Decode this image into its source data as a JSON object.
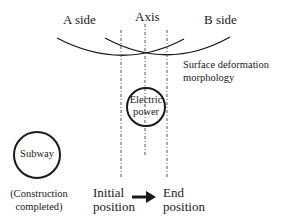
{
  "labels": {
    "a_side": "A side",
    "axis": "Axis",
    "b_side": "B side",
    "surface_line1": "Surface deformation",
    "surface_line2": "morphology",
    "electric_line1": "Electric",
    "electric_line2": "power",
    "subway": "Subway",
    "construction_line1": "(Construction",
    "construction_line2": "completed)",
    "initial_line1": "Initial",
    "initial_line2": "position",
    "end_line1": "End",
    "end_line2": "position"
  },
  "colors": {
    "line": "#1a1a1a",
    "dash": "#555555",
    "background": "#ffffff"
  }
}
